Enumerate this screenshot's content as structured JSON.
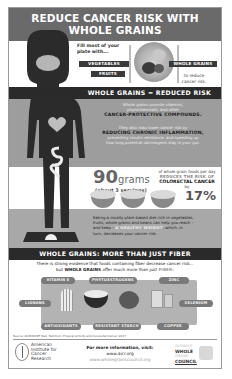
{
  "title": {
    "line1": "REDUCE CANCER RISK WITH",
    "line2": "WHOLE GRAINS"
  },
  "plate_section": {
    "intro_line1": "Fill most of your",
    "intro_line2": "plate with...",
    "tags": {
      "vegetables": "VEGETABLES",
      "fruits": "FRUITS",
      "whole_grains": "WHOLE GRAINS"
    },
    "to_reduce_line1": "to reduce",
    "to_reduce_line2": "cancer risk."
  },
  "section1": {
    "heading": "WHOLE GRAINS = REDUCED RISK",
    "para1_lines": [
      "Whole grains provide vitamins,",
      "phytochemicals, and other"
    ],
    "para1_emphasis": "CANCER-PROTECTIVE COMPOUNDS.",
    "para2_line1": "They also may lower cancer risk by",
    "para2_emphasis": "REDUCING CHRONIC INFLAMMATION,",
    "para2_rest_lines": [
      "preventing insulin resistance, and speeding up",
      "how long potential carcinogens stay in your gut."
    ]
  },
  "stat": {
    "amount": "90",
    "unit": "grams",
    "servings": "(about 3 servings)",
    "desc_line1": "of whole grain foods per day",
    "desc_line2": "REDUCES THE RISK OF",
    "desc_line3": "COLORECTAL CANCER",
    "desc_line4": "by",
    "percent": "17%"
  },
  "weight_text": {
    "line1": "Eating a mostly plant-based diet rich in vegetables,",
    "line2": "fruits, whole grains and beans can help you reach –",
    "line3_pre": "and keep – ",
    "highlight": "A HEALTHY WEIGHT",
    "line3_post": ", which, in",
    "line4": "turn, decreases your cancer risk."
  },
  "section2": {
    "heading": "WHOLE GRAINS: MORE THAN JUST FIBER",
    "intro_line1": "There is strong evidence that foods containing fiber decrease cancer risk...",
    "intro_pre": "but ",
    "intro_bold": "WHOLE GRAINS",
    "intro_mid": " offer much more than just ",
    "intro_fiber": "FIBER:",
    "nutrients": {
      "vitamin_e": "VITAMIN E",
      "phytoestrogens": "PHYTOESTROGENS",
      "zinc": "ZINC",
      "lignans": "LIGNANS",
      "selenium": "SELENIUM",
      "antioxidants": "ANTIOXIDANTS",
      "resistant_starch": "RESISTANT STARCH",
      "copper": "COPPER"
    }
  },
  "footer": {
    "source": "Source: AICR/WCRF Diet, Nutrition, Physical Activity and Colorectal Cancer. 2017",
    "aicr_lines": [
      "American",
      "Institute for",
      "Cancer",
      "Research"
    ],
    "info_heading": "For more information, visit:",
    "site1": "www.aicr.org",
    "site2": "www.wholegrainscouncil.org",
    "wgc_lines": [
      "OLDWAYS",
      "WHOLE",
      "GRAINS",
      "COUNCIL"
    ]
  },
  "colors": {
    "title_band": "#6a6a6a",
    "dark_band": "#2a2a2a",
    "gray_zone": "#9d9d9d",
    "pill": "#7a7a7a"
  }
}
